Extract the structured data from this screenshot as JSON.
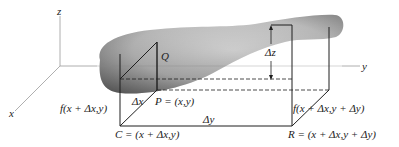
{
  "figure": {
    "axes": {
      "z_label": "z",
      "x_label": "x",
      "y_label": "y"
    },
    "points": {
      "Q": "Q",
      "P": "P = (x,y)",
      "C": "C = (x + Δx,y)",
      "R": "R = (x + Δx,y + Δy)"
    },
    "function_values": {
      "left": "f(x + Δx,y)",
      "right": "f(x + Δx,y + Δy)"
    },
    "increments": {
      "dx": "Δx",
      "dy": "Δy",
      "dz": "Δz"
    },
    "colors": {
      "surface_light": "#e8e8e8",
      "surface_dark": "#6e6e6e",
      "line": "#222222",
      "axis": "#9a9a9a"
    }
  }
}
